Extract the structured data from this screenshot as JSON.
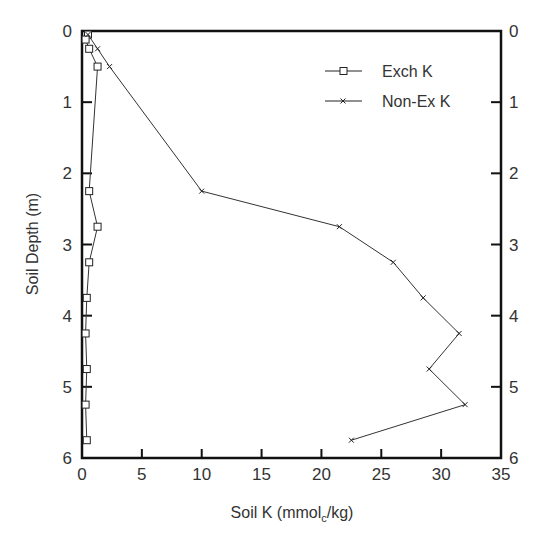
{
  "chart_data": {
    "type": "line",
    "title": "",
    "xlabel": "Soil K (mmol_c/kg)",
    "xlabel_main": "Soil K (mmol",
    "xlabel_sub": "c",
    "xlabel_end": "/kg)",
    "ylabel": "Soil Depth (m)",
    "xlim": [
      0,
      35
    ],
    "ylim": [
      0,
      6
    ],
    "y_inverted": true,
    "x_ticks": [
      "0",
      "5",
      "10",
      "15",
      "20",
      "25",
      "30",
      "35"
    ],
    "y_ticks": [
      "0",
      "1",
      "2",
      "3",
      "4",
      "5",
      "6"
    ],
    "grid": false,
    "legend_position": "upper right",
    "series": [
      {
        "name": "Exch K",
        "marker": "square",
        "points": [
          [
            0.5,
            0.05
          ],
          [
            0.3,
            0.12
          ],
          [
            0.6,
            0.25
          ],
          [
            1.3,
            0.5
          ],
          [
            0.6,
            2.25
          ],
          [
            1.3,
            2.75
          ],
          [
            0.6,
            3.25
          ],
          [
            0.4,
            3.75
          ],
          [
            0.3,
            4.25
          ],
          [
            0.4,
            4.75
          ],
          [
            0.3,
            5.25
          ],
          [
            0.4,
            5.75
          ]
        ]
      },
      {
        "name": "Non-Ex K",
        "marker": "x",
        "points": [
          [
            0.5,
            0.05
          ],
          [
            1.3,
            0.25
          ],
          [
            2.3,
            0.5
          ],
          [
            10,
            2.25
          ],
          [
            21.5,
            2.75
          ],
          [
            26,
            3.25
          ],
          [
            28.5,
            3.75
          ],
          [
            31.5,
            4.25
          ],
          [
            29,
            4.75
          ],
          [
            32,
            5.25
          ],
          [
            22.5,
            5.75
          ]
        ]
      }
    ]
  }
}
